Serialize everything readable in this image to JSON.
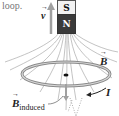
{
  "diagram": {
    "caption_fragment": "loop.",
    "magnet": {
      "top_pole": "S",
      "bottom_pole": "N"
    },
    "labels": {
      "velocity": "v",
      "field": "B",
      "induced_field": "B",
      "induced_subscript": "induced",
      "current": "I"
    },
    "colors": {
      "field_lines": "#9a9a9a",
      "loop": "#8a8a8a",
      "loop_fill": "#d8d8d8",
      "magnet_n": "#3a3a3a",
      "magnet_s": "#f2f2f2",
      "velocity_arrow": "#a0a0a0"
    }
  }
}
